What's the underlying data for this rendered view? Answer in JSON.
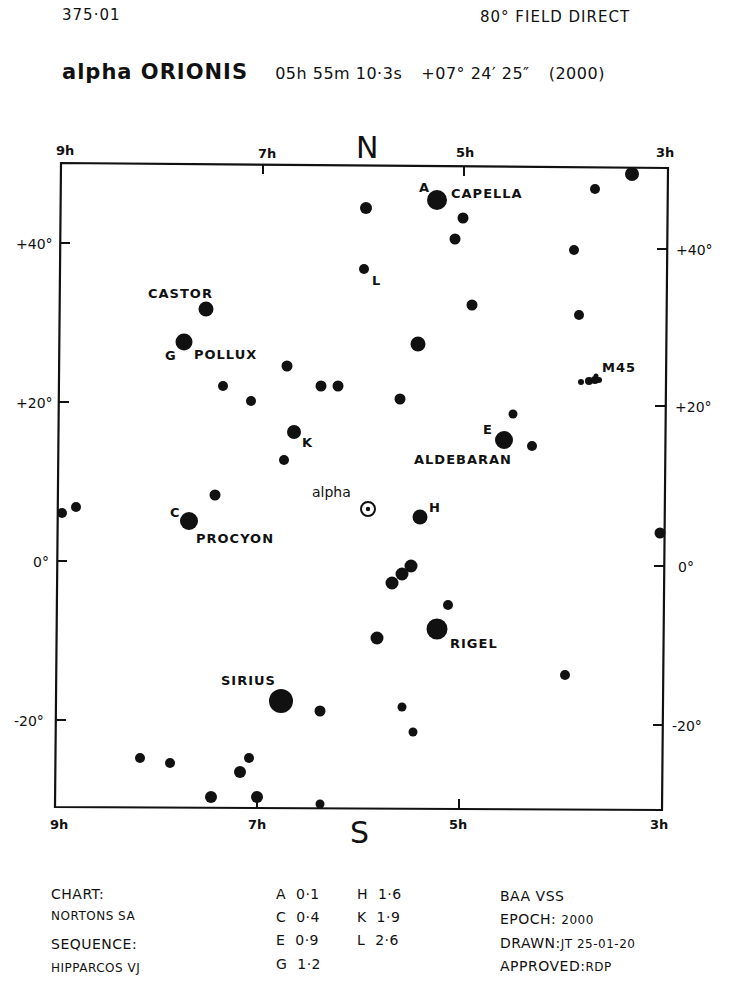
{
  "header": {
    "chart_id": "375·01",
    "field": "80° FIELD DIRECT",
    "star_name": "alpha ORIONIS",
    "ra": "05h 55m 10·3s",
    "dec": "+07° 24′ 25″",
    "epoch_label": "(2000)"
  },
  "compass": {
    "north": "N",
    "south": "S"
  },
  "axes": {
    "ra_ticks_top": [
      "9h",
      "7h",
      "5h",
      "3h"
    ],
    "ra_ticks_bottom": [
      "9h",
      "7h",
      "5h",
      "3h"
    ],
    "dec_ticks_left": [
      "+40°",
      "+20°",
      "0°",
      "-20°"
    ],
    "dec_ticks_right": [
      "+40°",
      "+20°",
      "0°",
      "-20°"
    ]
  },
  "labels": {
    "capella": "CAPELLA",
    "A": "A",
    "castor": "CASTOR",
    "pollux": "POLLUX",
    "G": "G",
    "L": "L",
    "K": "K",
    "M45": "M45",
    "aldebaran": "ALDEBARAN",
    "E": "E",
    "alpha": "alpha",
    "H": "H",
    "procyon": "PROCYON",
    "C": "C",
    "rigel": "RIGEL",
    "sirius": "SIRIUS"
  },
  "chart_data": {
    "type": "scatter",
    "title": "alpha ORIONIS 05h 55m 10·3s +07° 24′ 25″ (2000)",
    "subtitle": "80° FIELD DIRECT",
    "xlabel": "Right Ascension",
    "ylabel": "Declination",
    "x_ticks": [
      "9h",
      "7h",
      "5h",
      "3h"
    ],
    "y_ticks": [
      "+40°",
      "+20°",
      "0°",
      "-20°"
    ],
    "xlim": [
      "9h",
      "3h"
    ],
    "ylim": [
      -31,
      49
    ],
    "grid": false,
    "variable_star": {
      "name": "alpha",
      "ra_h": 5.92,
      "dec": 7.4,
      "symbol": "circled-dot"
    },
    "comparison_stars": [
      {
        "id": "A",
        "name": "CAPELLA",
        "mag": "0·1"
      },
      {
        "id": "C",
        "name": "PROCYON",
        "mag": "0·4"
      },
      {
        "id": "E",
        "name": "ALDEBARAN",
        "mag": "0·9"
      },
      {
        "id": "G",
        "name": "POLLUX",
        "mag": "1·2"
      },
      {
        "id": "H",
        "name": "",
        "mag": "1·6"
      },
      {
        "id": "K",
        "name": "",
        "mag": "1·9"
      },
      {
        "id": "L",
        "name": "",
        "mag": "2·6"
      }
    ],
    "named_stars": [
      "CAPELLA",
      "CASTOR",
      "POLLUX",
      "ALDEBARAN",
      "PROCYON",
      "RIGEL",
      "SIRIUS",
      "M45"
    ]
  },
  "stars": [
    {
      "x": 437,
      "y": 200,
      "r": 10
    },
    {
      "x": 366,
      "y": 208,
      "r": 6
    },
    {
      "x": 463,
      "y": 218,
      "r": 5.5
    },
    {
      "x": 455,
      "y": 239,
      "r": 5.5
    },
    {
      "x": 364,
      "y": 269,
      "r": 5
    },
    {
      "x": 595,
      "y": 189,
      "r": 5
    },
    {
      "x": 632,
      "y": 174,
      "r": 7
    },
    {
      "x": 574,
      "y": 250,
      "r": 5
    },
    {
      "x": 472,
      "y": 305,
      "r": 5.5
    },
    {
      "x": 579,
      "y": 315,
      "r": 5
    },
    {
      "x": 206,
      "y": 309,
      "r": 7.5
    },
    {
      "x": 184,
      "y": 342,
      "r": 8.5
    },
    {
      "x": 418,
      "y": 344,
      "r": 7.5
    },
    {
      "x": 287,
      "y": 366,
      "r": 5.5
    },
    {
      "x": 223,
      "y": 386,
      "r": 5
    },
    {
      "x": 321,
      "y": 386,
      "r": 5.5
    },
    {
      "x": 338,
      "y": 386,
      "r": 5.5
    },
    {
      "x": 251,
      "y": 401,
      "r": 5
    },
    {
      "x": 400,
      "y": 399,
      "r": 5.5
    },
    {
      "x": 513,
      "y": 414,
      "r": 4.5
    },
    {
      "x": 294,
      "y": 432,
      "r": 7
    },
    {
      "x": 504,
      "y": 440,
      "r": 9
    },
    {
      "x": 532,
      "y": 446,
      "r": 5
    },
    {
      "x": 284,
      "y": 460,
      "r": 5
    },
    {
      "x": 215,
      "y": 495,
      "r": 5.5
    },
    {
      "x": 62,
      "y": 513,
      "r": 5
    },
    {
      "x": 76,
      "y": 507,
      "r": 5
    },
    {
      "x": 189,
      "y": 521,
      "r": 9
    },
    {
      "x": 420,
      "y": 517,
      "r": 7.5
    },
    {
      "x": 660,
      "y": 533,
      "r": 5.5
    },
    {
      "x": 411,
      "y": 566,
      "r": 6.5
    },
    {
      "x": 402,
      "y": 574,
      "r": 6.5
    },
    {
      "x": 392,
      "y": 583,
      "r": 6.5
    },
    {
      "x": 448,
      "y": 605,
      "r": 5
    },
    {
      "x": 377,
      "y": 638,
      "r": 6.5
    },
    {
      "x": 437,
      "y": 629,
      "r": 10.5
    },
    {
      "x": 565,
      "y": 675,
      "r": 5
    },
    {
      "x": 281,
      "y": 701,
      "r": 12
    },
    {
      "x": 320,
      "y": 711,
      "r": 5.5
    },
    {
      "x": 402,
      "y": 707,
      "r": 4.5
    },
    {
      "x": 413,
      "y": 732,
      "r": 4.5
    },
    {
      "x": 140,
      "y": 758,
      "r": 5
    },
    {
      "x": 170,
      "y": 763,
      "r": 5
    },
    {
      "x": 249,
      "y": 758,
      "r": 5
    },
    {
      "x": 240,
      "y": 772,
      "r": 6
    },
    {
      "x": 211,
      "y": 797,
      "r": 6
    },
    {
      "x": 257,
      "y": 797,
      "r": 6
    },
    {
      "x": 320,
      "y": 804,
      "r": 4.5
    }
  ],
  "m45_cluster": [
    {
      "x": 581,
      "y": 382,
      "r": 3
    },
    {
      "x": 589,
      "y": 381,
      "r": 4
    },
    {
      "x": 595,
      "y": 380,
      "r": 4
    },
    {
      "x": 596,
      "y": 376,
      "r": 2.5
    },
    {
      "x": 599,
      "y": 380,
      "r": 3
    }
  ],
  "footer": {
    "left": {
      "chart_label": "CHART:",
      "chart_value": "NORTONS SA",
      "sequence_label": "SEQUENCE:",
      "sequence_value": "HIPPARCOS VJ"
    },
    "sequence": {
      "col1": [
        "A  0·1",
        "C  0·4",
        "E  0·9",
        "G  1·2"
      ],
      "col2": [
        "H  1·6",
        "K  1·9",
        "L  2·6"
      ]
    },
    "right": {
      "org": "BAA VSS",
      "epoch_label": "EPOCH:",
      "epoch_value": "2000",
      "drawn_label": "DRAWN:",
      "drawn_value": "JT 25-01-20",
      "approved_label": "APPROVED:",
      "approved_value": "RDP"
    }
  }
}
